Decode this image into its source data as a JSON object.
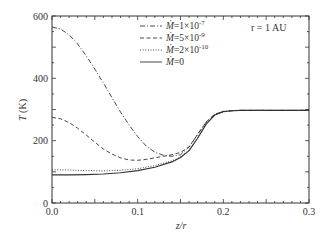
{
  "chart_data": {
    "type": "line",
    "title": "",
    "xlabel": "z/r",
    "ylabel": "T (K)",
    "xlim": [
      0.0,
      0.3
    ],
    "ylim": [
      0,
      600
    ],
    "xticks": [
      "0.0",
      "0.1",
      "0.2",
      "0.3"
    ],
    "yticks": [
      "0",
      "200",
      "400",
      "600"
    ],
    "grid": false,
    "legend_position": "upper center",
    "annotation": "r = 1 AU",
    "series": [
      {
        "name": "Ṁ = 1×10⁻⁷",
        "label_parts": [
          "Ṁ",
          "=1×10",
          "-7"
        ],
        "style": "dashdot",
        "x": [
          0.0,
          0.01,
          0.02,
          0.03,
          0.04,
          0.05,
          0.06,
          0.07,
          0.08,
          0.09,
          0.1,
          0.11,
          0.12,
          0.13,
          0.14,
          0.15,
          0.16,
          0.17,
          0.18,
          0.19,
          0.2,
          0.21,
          0.22,
          0.25,
          0.3
        ],
        "y": [
          565,
          558,
          540,
          510,
          472,
          430,
          385,
          338,
          292,
          250,
          213,
          183,
          163,
          153,
          150,
          155,
          180,
          220,
          260,
          285,
          294,
          296,
          297,
          297,
          297
        ]
      },
      {
        "name": "Ṁ = 5×10⁻⁹",
        "label_parts": [
          "Ṁ",
          "=5×10",
          "-9"
        ],
        "style": "dashed",
        "x": [
          0.0,
          0.01,
          0.02,
          0.03,
          0.04,
          0.05,
          0.06,
          0.07,
          0.08,
          0.09,
          0.1,
          0.11,
          0.12,
          0.13,
          0.14,
          0.15,
          0.16,
          0.17,
          0.18,
          0.19,
          0.2,
          0.21,
          0.22,
          0.25,
          0.3
        ],
        "y": [
          275,
          270,
          258,
          240,
          218,
          195,
          173,
          157,
          145,
          138,
          137,
          140,
          145,
          150,
          155,
          162,
          180,
          220,
          260,
          285,
          294,
          296,
          297,
          297,
          297
        ]
      },
      {
        "name": "Ṁ = 2×10⁻¹⁰",
        "label_parts": [
          "Ṁ",
          "=2×10",
          "-10"
        ],
        "style": "dotted",
        "x": [
          0.0,
          0.02,
          0.04,
          0.06,
          0.08,
          0.1,
          0.12,
          0.14,
          0.15,
          0.16,
          0.17,
          0.18,
          0.19,
          0.2,
          0.21,
          0.22,
          0.25,
          0.3
        ],
        "y": [
          107,
          106,
          104,
          103,
          105,
          110,
          120,
          135,
          148,
          170,
          210,
          255,
          283,
          293,
          296,
          297,
          297,
          297
        ]
      },
      {
        "name": "Ṁ = 0",
        "label_parts": [
          "Ṁ",
          "=0",
          ""
        ],
        "style": "solid",
        "x": [
          0.0,
          0.02,
          0.04,
          0.06,
          0.08,
          0.1,
          0.12,
          0.14,
          0.15,
          0.16,
          0.17,
          0.18,
          0.19,
          0.2,
          0.21,
          0.22,
          0.25,
          0.3
        ],
        "y": [
          90,
          90,
          91,
          93,
          97,
          104,
          115,
          132,
          146,
          168,
          208,
          253,
          282,
          293,
          296,
          297,
          297,
          297
        ]
      }
    ]
  }
}
